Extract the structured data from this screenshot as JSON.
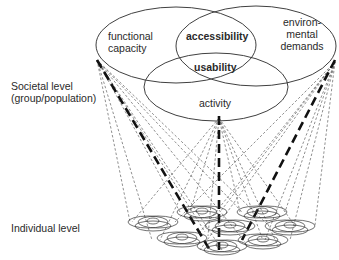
{
  "diagram": {
    "venn_labels": {
      "functional_capacity": [
        "functional",
        "capacity"
      ],
      "environmental_demands": [
        "environ-",
        "mental",
        "demands"
      ],
      "accessibility": "accessibility",
      "usability": "usability",
      "activity": "activity"
    },
    "levels": {
      "societal": [
        "Societal level",
        "(group/population)"
      ],
      "individual": "Individual level"
    },
    "colors": {
      "line": "#2a2a2a",
      "background": "#ffffff"
    }
  }
}
